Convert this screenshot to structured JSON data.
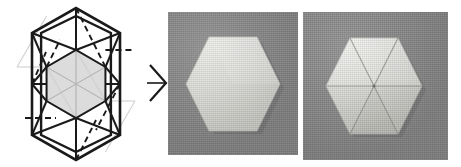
{
  "figure": {
    "type": "origami-step-sequence",
    "panel_count": 3,
    "caption": "",
    "colors": {
      "page_background": "#ffffff",
      "crease_line_dark": "#1a1a1a",
      "crease_line_light": "#cfcfcf",
      "inner_hexagon_fill": "#dcdcdc",
      "photo_background_gray": "#8a8a8a",
      "paper_white": "#e9e9e6",
      "paper_shadow": "#c9c9c4",
      "arrow_color": "#1a1a1a"
    }
  },
  "panels": [
    {
      "id": "crease-pattern",
      "kind": "diagram",
      "label": "hexagonal crease pattern",
      "shape": "hexagon",
      "outer_hexagon": {
        "stroke": "#1a1a1a",
        "stroke_width": 2.4,
        "fill": "#ffffff"
      },
      "inner_hexagon": {
        "fill": "#dcdcdc",
        "stroke": "#1a1a1a",
        "stroke_width": 2.0,
        "radius_ratio": 0.5
      },
      "line_types": [
        {
          "name": "mountain-fold-solid",
          "style": "solid",
          "color": "#1a1a1a"
        },
        {
          "name": "valley-fold-dashed",
          "style": "dashed",
          "color": "#1a1a1a"
        },
        {
          "name": "reference-line-light",
          "style": "solid",
          "color": "#cfcfcf"
        }
      ],
      "sector_count": 6
    },
    {
      "id": "photo-folded-blank",
      "kind": "photograph",
      "label": "white hexagonal paper on gray background",
      "subject": "hexagon",
      "creases_visible": 0,
      "background": "#8a8a8a"
    },
    {
      "id": "photo-radial-creases",
      "kind": "photograph",
      "label": "hexagonal paper with six radial creases",
      "subject": "hexagon",
      "creases_visible": 6,
      "background": "#8a8a8a"
    }
  ],
  "arrow": {
    "name": "step-arrow",
    "direction": "right",
    "glyph": "chevron"
  }
}
